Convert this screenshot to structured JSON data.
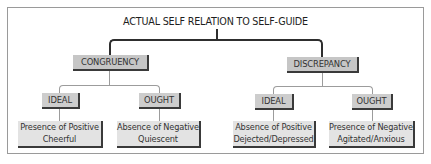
{
  "diagram": {
    "title": "ACTUAL SELF RELATION TO SELF-GUIDE",
    "branches": [
      {
        "label": "CONGRUENCY",
        "children": [
          {
            "label": "IDEAL",
            "outcome": {
              "line1": "Presence of Positive",
              "line2": "Cheerful"
            }
          },
          {
            "label": "OUGHT",
            "outcome": {
              "line1": "Absence of Negative",
              "line2": "Quiescent"
            }
          }
        ]
      },
      {
        "label": "DISCREPANCY",
        "children": [
          {
            "label": "IDEAL",
            "outcome": {
              "line1": "Absence of Positive",
              "line2": "Dejected/Depressed"
            }
          },
          {
            "label": "OUGHT",
            "outcome": {
              "line1": "Presence of Negative",
              "line2": "Agitated/Anxious"
            }
          }
        ]
      }
    ]
  },
  "colors": {
    "level1_fill": "#c6c6c6",
    "level2_fill": "#cdcdcd",
    "leaf_fill": "#e3e3e3",
    "shadow_edge": "#3a3a3a",
    "frame_border": "#9a9a9a"
  }
}
